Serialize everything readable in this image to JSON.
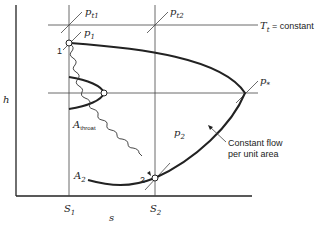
{
  "diagram": {
    "axes": {
      "y_label": "h",
      "x_label": "s"
    },
    "entropy_marks": {
      "s1": {
        "main": "S",
        "sub": "1"
      },
      "s2": {
        "main": "S",
        "sub": "2"
      }
    },
    "isobars": {
      "pt1": {
        "main": "p",
        "sub": "t1"
      },
      "pt2": {
        "main": "p",
        "sub": "t2"
      },
      "p1": {
        "main": "p",
        "sub": "1"
      },
      "p2": {
        "main": "p",
        "sub": "2"
      },
      "pstar": {
        "main": "p",
        "sub": "*"
      }
    },
    "tt_line": {
      "main": "T",
      "sub": "t",
      "rest": " = constant"
    },
    "points": {
      "state1": "1",
      "state2": "2"
    },
    "areas": {
      "throat": {
        "main": "A",
        "sub": "throat"
      },
      "a2": {
        "main": "A",
        "sub": "2"
      }
    },
    "annotation": {
      "line1": "Constant flow",
      "line2": "per unit area"
    }
  }
}
